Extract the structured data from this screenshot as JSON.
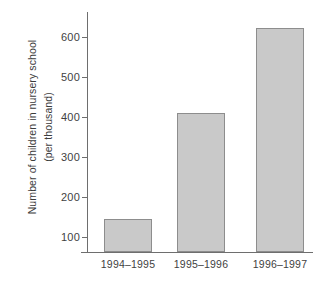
{
  "chart_data": {
    "type": "bar",
    "title": "",
    "subtitle": "",
    "xlabel": "",
    "ylabel": "Number of children in nursery school (per thousand)",
    "ylabel_lines": [
      "Number of children in nursery school",
      "(per thousand)"
    ],
    "categories": [
      "1994–1995",
      "1995–1996",
      "1996–1997"
    ],
    "values": [
      92,
      383,
      615
    ],
    "ytick_labels": [
      "100",
      "200",
      "300",
      "400",
      "500",
      "600"
    ],
    "ytick_values": [
      100,
      200,
      300,
      400,
      500,
      600
    ],
    "ylim": [
      0,
      660
    ],
    "xlim_categories": 3,
    "grid": false,
    "legend": null,
    "legend_position": "none",
    "annotations": [],
    "colors": {
      "bar_fill": "#c9c9c9",
      "bar_border": "#8d8d8d",
      "axis": "#6e6e6e",
      "text": "#3f3f3f",
      "background": "#ffffff"
    }
  }
}
